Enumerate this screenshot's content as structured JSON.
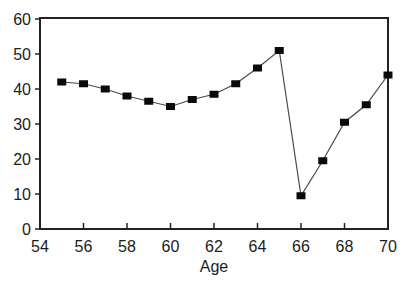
{
  "chart_data": {
    "type": "line",
    "title": "",
    "xlabel": "Age",
    "ylabel": "",
    "x": [
      55,
      56,
      57,
      58,
      59,
      60,
      61,
      62,
      63,
      64,
      65,
      66,
      67,
      68,
      69,
      70
    ],
    "values": [
      42,
      41.5,
      40,
      38,
      36.5,
      35,
      37,
      38.5,
      41.5,
      46,
      51,
      9.5,
      19.5,
      30.5,
      35.5,
      44
    ],
    "xlim": [
      54,
      70
    ],
    "ylim": [
      0,
      60
    ],
    "x_ticks": [
      54,
      56,
      58,
      60,
      62,
      64,
      66,
      68,
      70
    ],
    "y_ticks": [
      0,
      10,
      20,
      30,
      40,
      50,
      60
    ],
    "grid": false,
    "legend": null,
    "marker": "square",
    "colors": {
      "line": "#4a4a4a",
      "marker": "#0a0a0a",
      "frame": "#222222",
      "text": "#1c1c1c",
      "background": "#ffffff"
    }
  }
}
